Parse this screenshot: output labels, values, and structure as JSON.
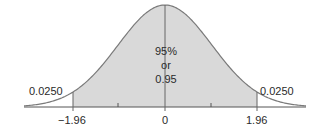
{
  "chart_data": {
    "type": "area",
    "title": "",
    "xlabel": "",
    "ylabel": "",
    "x_ticks": [
      {
        "value": -1.96,
        "label": "−1.96"
      },
      {
        "value": -1,
        "label": ""
      },
      {
        "value": 0,
        "label": "0"
      },
      {
        "value": 1,
        "label": ""
      },
      {
        "value": 1.96,
        "label": "1.96"
      }
    ],
    "xlim": [
      -2.8,
      2.8
    ],
    "shaded_region": {
      "from": -1.96,
      "to": 1.96,
      "area": 0.95
    },
    "annotations": {
      "center": [
        "95%",
        "or",
        "0.95"
      ],
      "left_tail": "0.0250",
      "right_tail": "0.0250"
    },
    "grid": false,
    "legend": null
  },
  "colors": {
    "fill": "#d9d9d9",
    "curve": "#7a7a7a",
    "axis": "#555555",
    "text": "#2a2a2a"
  }
}
